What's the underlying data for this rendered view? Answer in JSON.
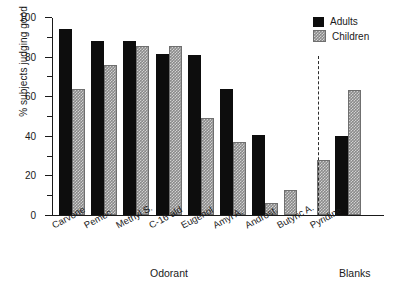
{
  "chart_data": {
    "type": "bar",
    "title": "",
    "xlabel": "Odorant",
    "ylabel": "% subjects judging good",
    "ylim": [
      0,
      100
    ],
    "ytick_labels": [
      "0",
      "20",
      "40",
      "60",
      "80",
      "100"
    ],
    "ytick_values": [
      0,
      20,
      40,
      60,
      80,
      100
    ],
    "yminor_tick_values": [
      10,
      30,
      50,
      70,
      90
    ],
    "grid": false,
    "legend_position": "top-right",
    "categories": [
      "Carvone",
      "Pemec",
      "Methyl S.",
      "C-16 ald",
      "Eugenol",
      "Amyl A.",
      "Androst.",
      "Butyric A.",
      "Pyridine",
      "Blanks"
    ],
    "series": [
      {
        "name": "Adults",
        "color": "#0d0d0d",
        "values": [
          94,
          88,
          88,
          81.5,
          81,
          63.5,
          40.5,
          0,
          0,
          40
        ]
      },
      {
        "name": "Children",
        "color": "#8a8a8a",
        "values": [
          63.5,
          76,
          85.5,
          85.5,
          49,
          37,
          6,
          12.5,
          28,
          63
        ]
      }
    ],
    "annotations": {
      "separator": "dashed vertical line before Blanks group",
      "blanks_group_label": "Blanks"
    }
  }
}
